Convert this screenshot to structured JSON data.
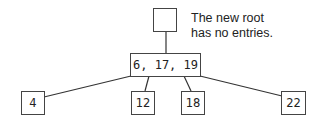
{
  "diagram": {
    "type": "b-tree",
    "root": {
      "entries": ""
    },
    "annotation": {
      "line1": "The new root",
      "line2": "has no entries."
    },
    "internal": {
      "entries": "6, 17, 19"
    },
    "leaves": [
      {
        "entries": "4"
      },
      {
        "entries": "12"
      },
      {
        "entries": "18"
      },
      {
        "entries": "22"
      }
    ],
    "line_color": "#333333"
  }
}
